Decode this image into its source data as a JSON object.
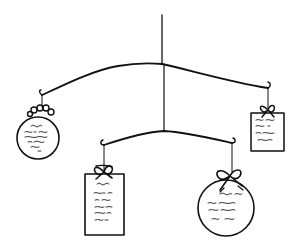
{
  "figure": {
    "title": "Hanging mobile line drawing",
    "background": "#ffffff",
    "ink_color": "#111111"
  },
  "mobile": {
    "top_bar": {
      "label": "upper crossbar"
    },
    "bottom_bar": {
      "label": "lower crossbar"
    },
    "ornaments": [
      {
        "id": "left-round",
        "shape": "circle",
        "position": "upper-left",
        "text_lines": 5,
        "decoration": "bow"
      },
      {
        "id": "right-tag",
        "shape": "rectangle",
        "position": "upper-right",
        "text_lines": 4,
        "decoration": "bow"
      },
      {
        "id": "middle-tag",
        "shape": "rectangle",
        "position": "lower-left",
        "text_lines": 6,
        "decoration": "bow"
      },
      {
        "id": "right-round",
        "shape": "circle",
        "position": "lower-right",
        "text_lines": 4,
        "decoration": "bow"
      }
    ]
  }
}
